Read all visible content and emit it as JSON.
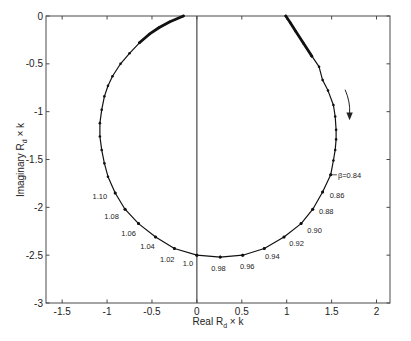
{
  "chart_data": {
    "type": "line",
    "title": "",
    "xlabel": "Real R_d × k",
    "ylabel": "Imaginary R_d × k",
    "xlabel_parts": [
      "Real R",
      "d",
      " × k"
    ],
    "ylabel_parts": [
      "Imaginary R",
      "d",
      " × k"
    ],
    "xlim": [
      -1.68,
      2.15
    ],
    "ylim": [
      -3,
      0
    ],
    "grid": false,
    "legend": null,
    "x_ticks": [
      -1.5,
      -1,
      -0.5,
      0,
      0.5,
      1,
      1.5,
      2
    ],
    "x_tick_labels": [
      "-1.5",
      "-1",
      "-0.5",
      "0",
      "0.5",
      "1",
      "1.5",
      "2"
    ],
    "y_ticks": [
      0,
      -0.5,
      -1,
      -1.5,
      -2,
      -2.5,
      -3
    ],
    "y_tick_labels": [
      "0",
      "-0.5",
      "-1",
      "-1.5",
      "-2",
      "-2.5",
      "-3"
    ],
    "reference_lines": [
      {
        "orientation": "vertical",
        "x": 0
      }
    ],
    "series": [
      {
        "name": "Locus (β sweep)",
        "markers": true,
        "points": [
          [
            0.99,
            0.0
          ],
          [
            1.04,
            -0.07
          ],
          [
            1.1,
            -0.16
          ],
          [
            1.19,
            -0.29
          ],
          [
            1.28,
            -0.42
          ],
          [
            1.36,
            -0.53
          ],
          [
            1.4,
            -0.67
          ],
          [
            1.46,
            -0.78
          ],
          [
            1.52,
            -0.93
          ],
          [
            1.54,
            -1.05
          ],
          [
            1.55,
            -1.19
          ],
          [
            1.55,
            -1.29
          ],
          [
            1.54,
            -1.4
          ],
          [
            1.52,
            -1.51
          ],
          [
            1.49,
            -1.66
          ],
          [
            1.4,
            -1.84
          ],
          [
            1.29,
            -2.02
          ],
          [
            1.16,
            -2.17
          ],
          [
            0.97,
            -2.31
          ],
          [
            0.75,
            -2.43
          ],
          [
            0.51,
            -2.5
          ],
          [
            0.26,
            -2.52
          ],
          [
            0.0,
            -2.5
          ],
          [
            -0.25,
            -2.43
          ],
          [
            -0.46,
            -2.31
          ],
          [
            -0.65,
            -2.17
          ],
          [
            -0.8,
            -2.02
          ],
          [
            -0.91,
            -1.85
          ],
          [
            -0.99,
            -1.68
          ],
          [
            -1.03,
            -1.54
          ],
          [
            -1.06,
            -1.4
          ],
          [
            -1.08,
            -1.26
          ],
          [
            -1.08,
            -1.12
          ],
          [
            -1.06,
            -0.98
          ],
          [
            -1.03,
            -0.84
          ],
          [
            -0.99,
            -0.73
          ],
          [
            -0.94,
            -0.63
          ],
          [
            -0.85,
            -0.5
          ],
          [
            -0.75,
            -0.39
          ],
          [
            -0.64,
            -0.28
          ],
          [
            -0.53,
            -0.19
          ],
          [
            -0.42,
            -0.12
          ],
          [
            -0.3,
            -0.06
          ],
          [
            -0.15,
            0.0
          ]
        ]
      }
    ],
    "dense_segments": [
      [
        [
          0.99,
          0.0
        ],
        [
          1.04,
          -0.07
        ],
        [
          1.1,
          -0.16
        ],
        [
          1.19,
          -0.29
        ],
        [
          1.28,
          -0.42
        ]
      ],
      [
        [
          -0.64,
          -0.28
        ],
        [
          -0.53,
          -0.19
        ],
        [
          -0.42,
          -0.12
        ],
        [
          -0.3,
          -0.06
        ],
        [
          -0.15,
          0.0
        ]
      ]
    ],
    "beta_points": [
      {
        "beta": 0.84,
        "x": 1.49,
        "y": -1.66,
        "label": "β=0.84",
        "label_x": 1.57,
        "label_y": -1.66,
        "anchor": "start",
        "leader": true
      },
      {
        "beta": 0.86,
        "x": 1.4,
        "y": -1.84,
        "label": "0.86",
        "label_x": 1.56,
        "label_y": -1.87,
        "anchor": "middle"
      },
      {
        "beta": 0.88,
        "x": 1.29,
        "y": -2.02,
        "label": "0.88",
        "label_x": 1.44,
        "label_y": -2.04,
        "anchor": "middle"
      },
      {
        "beta": 0.9,
        "x": 1.16,
        "y": -2.17,
        "label": "0.90",
        "label_x": 1.31,
        "label_y": -2.24,
        "anchor": "middle"
      },
      {
        "beta": 0.92,
        "x": 0.97,
        "y": -2.31,
        "label": "0.92",
        "label_x": 1.11,
        "label_y": -2.38,
        "anchor": "middle"
      },
      {
        "beta": 0.94,
        "x": 0.75,
        "y": -2.43,
        "label": "0.94",
        "label_x": 0.84,
        "label_y": -2.51,
        "anchor": "middle"
      },
      {
        "beta": 0.96,
        "x": 0.51,
        "y": -2.5,
        "label": "0.96",
        "label_x": 0.56,
        "label_y": -2.62,
        "anchor": "middle"
      },
      {
        "beta": 0.98,
        "x": 0.26,
        "y": -2.52,
        "label": "0.98",
        "label_x": 0.24,
        "label_y": -2.64,
        "anchor": "middle"
      },
      {
        "beta": 1.0,
        "x": 0.0,
        "y": -2.5,
        "label": "1.0",
        "label_x": -0.1,
        "label_y": -2.59,
        "anchor": "middle"
      },
      {
        "beta": 1.02,
        "x": -0.25,
        "y": -2.43,
        "label": "1.02",
        "label_x": -0.33,
        "label_y": -2.54,
        "anchor": "middle"
      },
      {
        "beta": 1.04,
        "x": -0.46,
        "y": -2.31,
        "label": "1.04",
        "label_x": -0.55,
        "label_y": -2.41,
        "anchor": "middle"
      },
      {
        "beta": 1.06,
        "x": -0.65,
        "y": -2.17,
        "label": "1.06",
        "label_x": -0.76,
        "label_y": -2.27,
        "anchor": "middle"
      },
      {
        "beta": 1.08,
        "x": -0.8,
        "y": -2.02,
        "label": "1.08",
        "label_x": -0.95,
        "label_y": -2.09,
        "anchor": "middle"
      },
      {
        "beta": 1.1,
        "x": -0.91,
        "y": -1.85,
        "label": "1.10",
        "label_x": -1.08,
        "label_y": -1.88,
        "anchor": "middle"
      }
    ],
    "annotations": [
      {
        "type": "arrow",
        "meaning": "direction of increasing β (clockwise)",
        "path": [
          [
            1.65,
            -0.77
          ],
          [
            1.71,
            -0.9
          ],
          [
            1.7,
            -1.02
          ]
        ],
        "tip": [
          1.7,
          -1.09
        ]
      }
    ]
  }
}
